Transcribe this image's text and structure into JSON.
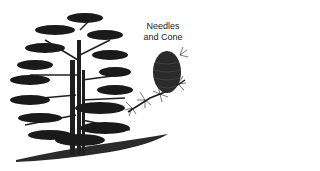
{
  "illustration": {
    "subject": "cedar tree",
    "inset_label_line1": "Needles",
    "inset_label_line2": "and Cone",
    "colors": {
      "ink": "#1a1a1a",
      "shadow": "#3a3a3a",
      "background": "#ffffff"
    }
  }
}
